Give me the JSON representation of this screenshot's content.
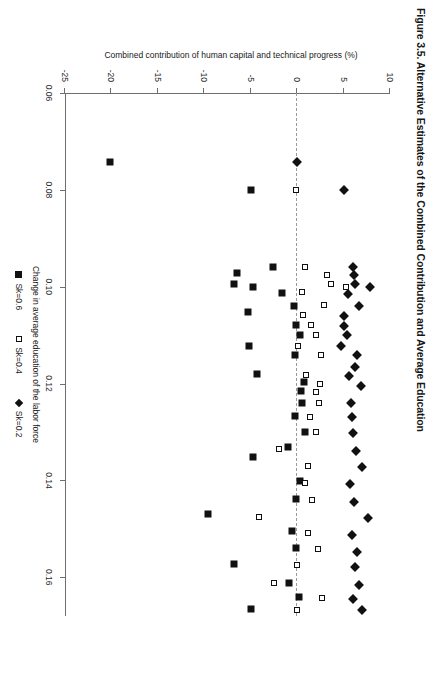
{
  "figure": {
    "title": "Figure 3.5.  Alternative Estimates of the Combined Contribution and Average Education"
  },
  "chart_data": {
    "type": "scatter",
    "title": "Figure 3.5.  Alternative Estimates of the Combined Contribution and Average Education",
    "xlabel": "Change in average education of the labor force",
    "ylabel": "Combined contribution of human capital and technical progress (%)",
    "xlim": [
      0.06,
      0.168
    ],
    "ylim": [
      -25,
      10
    ],
    "xticks": [
      "0.06",
      "0.08",
      "0.10",
      "0.12",
      "0.14",
      "0.16"
    ],
    "xtick_values": [
      0.06,
      0.08,
      0.1,
      0.12,
      0.14,
      0.16
    ],
    "yticks": [
      "10",
      "5",
      "0",
      "-5",
      "-10",
      "-15",
      "-20",
      "-25"
    ],
    "ytick_values": [
      10,
      5,
      0,
      -5,
      -10,
      -15,
      -20,
      -25
    ],
    "grid": false,
    "legend_position": "below-axis",
    "reference_line": {
      "axis": "y",
      "value": 0,
      "style": "dashed",
      "color": "#9a9a9a"
    },
    "series": [
      {
        "name": "Sk=0.6",
        "marker": "filled-square",
        "color": "#111111",
        "points": [
          [
            0.0742,
            -20.2
          ],
          [
            0.08,
            -5.0
          ],
          [
            0.096,
            -2.6
          ],
          [
            0.0972,
            -6.5
          ],
          [
            0.0995,
            -6.8
          ],
          [
            0.1,
            -4.7
          ],
          [
            0.1012,
            -1.6
          ],
          [
            0.104,
            -0.3
          ],
          [
            0.1052,
            -5.3
          ],
          [
            0.108,
            -0.1
          ],
          [
            0.11,
            0.3
          ],
          [
            0.1122,
            -5.2
          ],
          [
            0.114,
            -0.2
          ],
          [
            0.118,
            -4.3
          ],
          [
            0.1196,
            0.7
          ],
          [
            0.1215,
            0.4
          ],
          [
            0.124,
            0.5
          ],
          [
            0.1268,
            -0.2
          ],
          [
            0.13,
            0.9
          ],
          [
            0.133,
            -1.0
          ],
          [
            0.1352,
            -4.7
          ],
          [
            0.1402,
            0.3
          ],
          [
            0.1438,
            -0.1
          ],
          [
            0.147,
            -9.6
          ],
          [
            0.1505,
            -0.5
          ],
          [
            0.154,
            -0.1
          ],
          [
            0.1572,
            -6.8
          ],
          [
            0.1612,
            -0.9
          ],
          [
            0.164,
            0.2
          ],
          [
            0.1665,
            -5.0
          ]
        ]
      },
      {
        "name": "Sk=0.4",
        "marker": "open-square",
        "color": "#111111",
        "points": [
          [
            0.08,
            -0.1
          ],
          [
            0.096,
            0.8
          ],
          [
            0.0975,
            3.2
          ],
          [
            0.0995,
            3.6
          ],
          [
            0.1,
            5.3
          ],
          [
            0.101,
            0.5
          ],
          [
            0.1038,
            2.9
          ],
          [
            0.1058,
            0.6
          ],
          [
            0.108,
            1.5
          ],
          [
            0.11,
            2.0
          ],
          [
            0.1122,
            0.1
          ],
          [
            0.114,
            2.6
          ],
          [
            0.1182,
            1.0
          ],
          [
            0.12,
            2.5
          ],
          [
            0.1218,
            2.0
          ],
          [
            0.124,
            2.4
          ],
          [
            0.127,
            1.4
          ],
          [
            0.13,
            2.0
          ],
          [
            0.1335,
            -2.0
          ],
          [
            0.137,
            1.2
          ],
          [
            0.1405,
            0.9
          ],
          [
            0.144,
            1.6
          ],
          [
            0.1475,
            -4.1
          ],
          [
            0.1508,
            1.2
          ],
          [
            0.1542,
            2.2
          ],
          [
            0.1575,
            0.0
          ],
          [
            0.1612,
            -2.5
          ],
          [
            0.1642,
            2.7
          ],
          [
            0.1668,
            0.0
          ]
        ]
      },
      {
        "name": "Sk=0.2",
        "marker": "filled-diamond",
        "color": "#111111",
        "points": [
          [
            0.0742,
            0.0
          ],
          [
            0.08,
            5.1
          ],
          [
            0.096,
            6.0
          ],
          [
            0.0975,
            6.1
          ],
          [
            0.0995,
            6.2
          ],
          [
            0.1,
            7.9
          ],
          [
            0.1015,
            5.5
          ],
          [
            0.104,
            6.7
          ],
          [
            0.106,
            5.1
          ],
          [
            0.1082,
            5.0
          ],
          [
            0.11,
            5.4
          ],
          [
            0.1122,
            4.7
          ],
          [
            0.114,
            6.5
          ],
          [
            0.1165,
            6.2
          ],
          [
            0.1185,
            5.6
          ],
          [
            0.1205,
            6.9
          ],
          [
            0.124,
            5.8
          ],
          [
            0.127,
            5.9
          ],
          [
            0.1302,
            6.0
          ],
          [
            0.134,
            6.3
          ],
          [
            0.1372,
            7.0
          ],
          [
            0.1408,
            5.7
          ],
          [
            0.1445,
            6.1
          ],
          [
            0.1478,
            7.6
          ],
          [
            0.1512,
            5.9
          ],
          [
            0.1548,
            6.4
          ],
          [
            0.1578,
            6.2
          ],
          [
            0.1615,
            6.7
          ],
          [
            0.1645,
            6.0
          ],
          [
            0.1668,
            7.0
          ]
        ]
      }
    ]
  }
}
